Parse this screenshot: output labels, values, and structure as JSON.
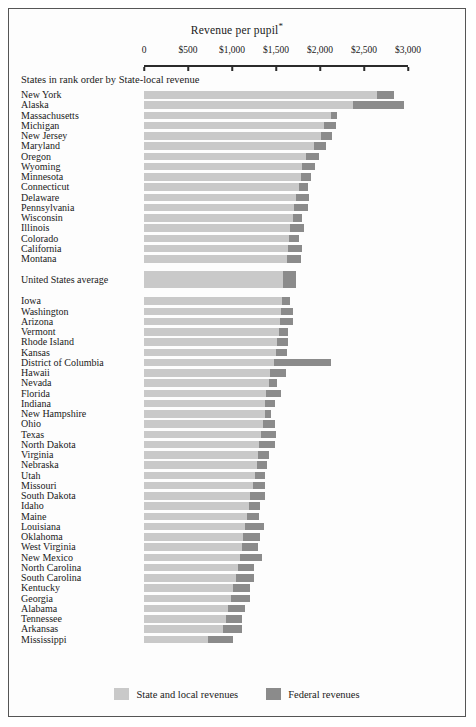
{
  "chart_data": {
    "type": "bar",
    "orientation": "horizontal",
    "stacked": true,
    "title": "Revenue per pupil",
    "title_footnote_marker": "*",
    "subtitle": "States in rank order by State-local revenue",
    "xlabel": "",
    "ylabel": "",
    "xlim": [
      0,
      3000
    ],
    "grid": false,
    "axis_tick_values": [
      0,
      500,
      1000,
      1500,
      2000,
      2500,
      3000
    ],
    "axis_tick_labels": [
      "0",
      "$500",
      "$1,000",
      "$1,500",
      "$2,000",
      "$2,500",
      "$3,000"
    ],
    "legend_position": "bottom",
    "series": [
      {
        "name": "State and local revenues",
        "color": "#c9c9c9"
      },
      {
        "name": "Federal revenues",
        "color": "#8b8b8b"
      }
    ],
    "categories": [
      "New York",
      "Alaska",
      "Massachusetts",
      "Michigan",
      "New Jersey",
      "Maryland",
      "Oregon",
      "Wyoming",
      "Minnesota",
      "Connecticut",
      "Delaware",
      "Pennsylvania",
      "Wisconsin",
      "Illinois",
      "Colorado",
      "California",
      "Montana",
      "United States average",
      "Iowa",
      "Washington",
      "Arizona",
      "Vermont",
      "Rhode Island",
      "Kansas",
      "District of Columbia",
      "Hawaii",
      "Nevada",
      "Florida",
      "Indiana",
      "New Hampshire",
      "Ohio",
      "Texas",
      "North Dakota",
      "Virginia",
      "Nebraska",
      "Utah",
      "Missouri",
      "South Dakota",
      "Idaho",
      "Maine",
      "Louisiana",
      "Oklahoma",
      "West Virginia",
      "New Mexico",
      "North Carolina",
      "South Carolina",
      "Kentucky",
      "Georgia",
      "Alabama",
      "Tennessee",
      "Arkansas",
      "Mississippi"
    ],
    "rows": [
      {
        "label": "New York",
        "state_local": 2650,
        "federal": 190,
        "is_average": false
      },
      {
        "label": "Alaska",
        "state_local": 2370,
        "federal": 580,
        "is_average": false
      },
      {
        "label": "Massachusetts",
        "state_local": 2120,
        "federal": 75,
        "is_average": false
      },
      {
        "label": "Michigan",
        "state_local": 2050,
        "federal": 130,
        "is_average": false
      },
      {
        "label": "New Jersey",
        "state_local": 2010,
        "federal": 130,
        "is_average": false
      },
      {
        "label": "Maryland",
        "state_local": 1930,
        "federal": 140,
        "is_average": false
      },
      {
        "label": "Oregon",
        "state_local": 1840,
        "federal": 145,
        "is_average": false
      },
      {
        "label": "Wyoming",
        "state_local": 1800,
        "federal": 145,
        "is_average": false
      },
      {
        "label": "Minnesota",
        "state_local": 1780,
        "federal": 120,
        "is_average": false
      },
      {
        "label": "Connecticut",
        "state_local": 1760,
        "federal": 100,
        "is_average": false
      },
      {
        "label": "Delaware",
        "state_local": 1730,
        "federal": 140,
        "is_average": false
      },
      {
        "label": "Pennsylvania",
        "state_local": 1700,
        "federal": 160,
        "is_average": false
      },
      {
        "label": "Wisconsin",
        "state_local": 1690,
        "federal": 110,
        "is_average": false
      },
      {
        "label": "Illinois",
        "state_local": 1660,
        "federal": 160,
        "is_average": false
      },
      {
        "label": "Colorado",
        "state_local": 1650,
        "federal": 110,
        "is_average": false
      },
      {
        "label": "California",
        "state_local": 1640,
        "federal": 150,
        "is_average": false
      },
      {
        "label": "Montana",
        "state_local": 1620,
        "federal": 160,
        "is_average": false
      },
      {
        "label": "United States average",
        "state_local": 1580,
        "federal": 145,
        "is_average": true
      },
      {
        "label": "Iowa",
        "state_local": 1570,
        "federal": 90,
        "is_average": false
      },
      {
        "label": "Washington",
        "state_local": 1560,
        "federal": 135,
        "is_average": false
      },
      {
        "label": "Arizona",
        "state_local": 1545,
        "federal": 145,
        "is_average": false
      },
      {
        "label": "Vermont",
        "state_local": 1530,
        "federal": 105,
        "is_average": false
      },
      {
        "label": "Rhode Island",
        "state_local": 1510,
        "federal": 130,
        "is_average": false
      },
      {
        "label": "Kansas",
        "state_local": 1500,
        "federal": 125,
        "is_average": false
      },
      {
        "label": "District of Columbia",
        "state_local": 1480,
        "federal": 640,
        "is_average": false
      },
      {
        "label": "Hawaii",
        "state_local": 1430,
        "federal": 180,
        "is_average": false
      },
      {
        "label": "Nevada",
        "state_local": 1420,
        "federal": 95,
        "is_average": false
      },
      {
        "label": "Florida",
        "state_local": 1390,
        "federal": 165,
        "is_average": false
      },
      {
        "label": "Indiana",
        "state_local": 1380,
        "federal": 105,
        "is_average": false
      },
      {
        "label": "New Hampshire",
        "state_local": 1370,
        "federal": 75,
        "is_average": false
      },
      {
        "label": "Ohio",
        "state_local": 1350,
        "federal": 135,
        "is_average": false
      },
      {
        "label": "Texas",
        "state_local": 1330,
        "federal": 165,
        "is_average": false
      },
      {
        "label": "North Dakota",
        "state_local": 1310,
        "federal": 175,
        "is_average": false
      },
      {
        "label": "Virginia",
        "state_local": 1290,
        "federal": 130,
        "is_average": false
      },
      {
        "label": "Nebraska",
        "state_local": 1280,
        "federal": 120,
        "is_average": false
      },
      {
        "label": "Utah",
        "state_local": 1260,
        "federal": 115,
        "is_average": false
      },
      {
        "label": "Missouri",
        "state_local": 1240,
        "federal": 140,
        "is_average": false
      },
      {
        "label": "South Dakota",
        "state_local": 1210,
        "federal": 170,
        "is_average": false
      },
      {
        "label": "Idaho",
        "state_local": 1190,
        "federal": 125,
        "is_average": false
      },
      {
        "label": "Maine",
        "state_local": 1170,
        "federal": 135,
        "is_average": false
      },
      {
        "label": "Louisiana",
        "state_local": 1150,
        "federal": 215,
        "is_average": false
      },
      {
        "label": "Oklahoma",
        "state_local": 1130,
        "federal": 185,
        "is_average": false
      },
      {
        "label": "West Virginia",
        "state_local": 1110,
        "federal": 185,
        "is_average": false
      },
      {
        "label": "New Mexico",
        "state_local": 1090,
        "federal": 250,
        "is_average": false
      },
      {
        "label": "North Carolina",
        "state_local": 1070,
        "federal": 185,
        "is_average": false
      },
      {
        "label": "South Carolina",
        "state_local": 1040,
        "federal": 210,
        "is_average": false
      },
      {
        "label": "Kentucky",
        "state_local": 1010,
        "federal": 195,
        "is_average": false
      },
      {
        "label": "Georgia",
        "state_local": 990,
        "federal": 215,
        "is_average": false
      },
      {
        "label": "Alabama",
        "state_local": 960,
        "federal": 190,
        "is_average": false
      },
      {
        "label": "Tennessee",
        "state_local": 930,
        "federal": 185,
        "is_average": false
      },
      {
        "label": "Arkansas",
        "state_local": 900,
        "federal": 215,
        "is_average": false
      },
      {
        "label": "Mississippi",
        "state_local": 730,
        "federal": 285,
        "is_average": false
      }
    ]
  },
  "legend": {
    "state_label": "State and local revenues",
    "federal_label": "Federal revenues"
  },
  "layout": {
    "plot_left_px": 144,
    "plot_right_px": 408
  }
}
